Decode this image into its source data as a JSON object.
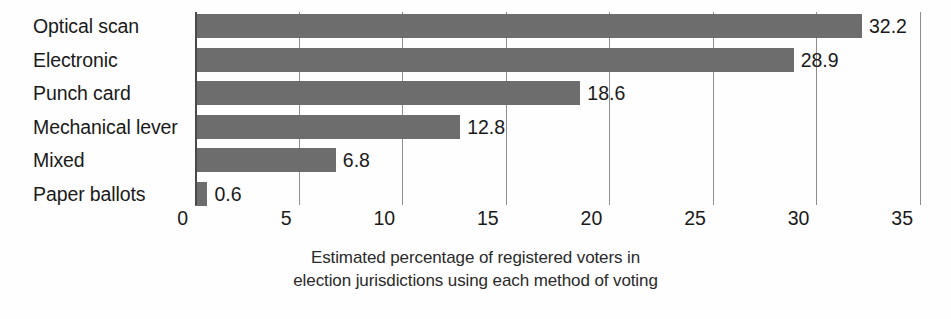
{
  "chart_data": {
    "type": "bar",
    "orientation": "horizontal",
    "title": "",
    "subtitle": "",
    "xlabel": "Estimated percentage of registered voters in election jurisdictions using each method of voting",
    "ylabel": "",
    "categories": [
      "Optical scan",
      "Electronic",
      "Punch card",
      "Mechanical lever",
      "Mixed",
      "Paper ballots"
    ],
    "values": [
      32.2,
      28.9,
      18.6,
      12.8,
      6.8,
      0.6
    ],
    "value_labels": [
      "32.2",
      "28.9",
      "18.6",
      "12.8",
      "6.8",
      "0.6"
    ],
    "xlim": [
      0,
      35
    ],
    "xticks": [
      0,
      5,
      10,
      15,
      20,
      25,
      30,
      35
    ],
    "xtick_labels": [
      "0",
      "5",
      "10",
      "15",
      "20",
      "25",
      "30",
      "35"
    ],
    "grid": true,
    "grid_axis": "x",
    "legend": false,
    "legend_position": "none",
    "bar_color": "#6d6d6d",
    "grid_color": "#8e8e8e",
    "axis_color": "#4a4a4a",
    "text_color": "#1a1a1a",
    "background_color": "#fefefe"
  },
  "caption": {
    "line1": "Estimated percentage of registered voters in",
    "line2": "election jurisdictions using each method of voting"
  }
}
